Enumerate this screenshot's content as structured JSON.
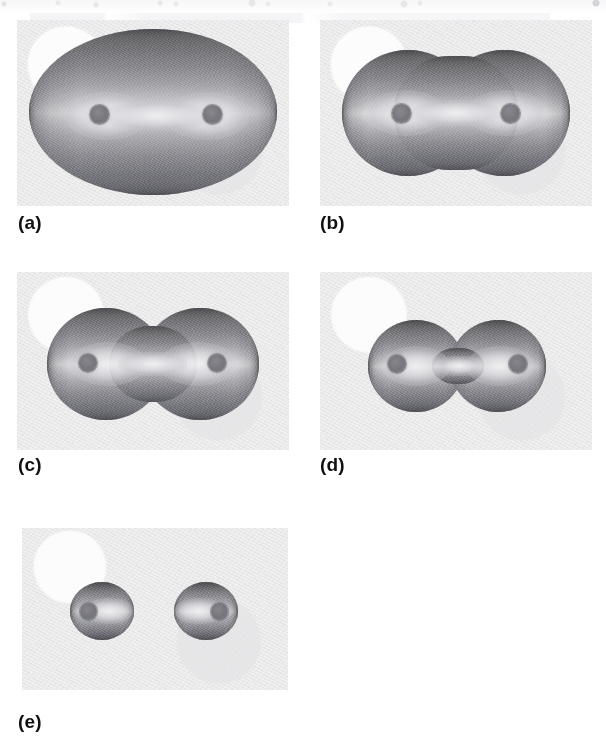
{
  "figure": {
    "panel_count": 5,
    "background_color": "#ffffff",
    "paper_color": "#f0f0f0",
    "surface_dark_color": "#5d5d60",
    "surface_light_color": "#dcdcdf",
    "nucleus_color": "#707077"
  },
  "panels": [
    {
      "label": "(a)",
      "name": "panel-a",
      "shape": "merged-ellipsoid",
      "waist_ratio": 1.0,
      "nuclei": 2,
      "description": "Single smooth ellipsoidal isosurface enclosing both nuclei; no constriction."
    },
    {
      "label": "(b)",
      "name": "panel-b",
      "shape": "slightly-pinched-ellipsoid",
      "waist_ratio": 0.88,
      "nuclei": 2,
      "description": "Elongated isosurface with a faint waist beginning to form at the midpoint."
    },
    {
      "label": "(c)",
      "name": "panel-c",
      "shape": "peanut",
      "waist_ratio": 0.68,
      "nuclei": 2,
      "description": "Peanut-shaped isosurface with a clear central constriction between two lobes."
    },
    {
      "label": "(d)",
      "name": "panel-d",
      "shape": "dumbbell",
      "waist_ratio": 0.34,
      "nuclei": 2,
      "description": "Dumbbell isosurface with a narrow neck joining two nearly spherical lobes."
    },
    {
      "label": "(e)",
      "name": "panel-e",
      "shape": "separated-spheroids",
      "waist_ratio": 0.0,
      "nuclei": 2,
      "description": "Isosurface has split into two isolated spheroids, one about each nucleus."
    }
  ]
}
